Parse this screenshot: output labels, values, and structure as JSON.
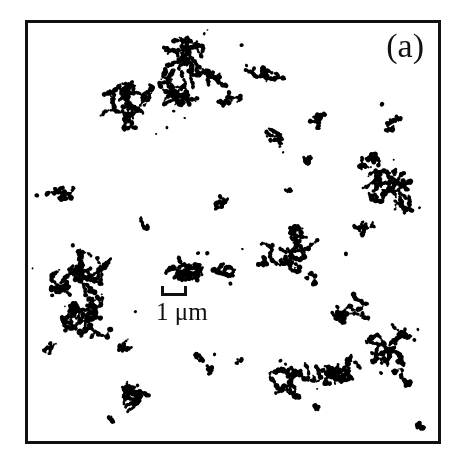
{
  "figure": {
    "domain_type": "micrograph",
    "panel_label": "(a)",
    "background_color": "#ffffff",
    "particle_color": "#000000",
    "frame_color": "#111111",
    "frame": {
      "x": 25,
      "y": 20,
      "width": 416,
      "height": 424,
      "border_px": 3
    },
    "image_width": 461,
    "image_height": 462
  },
  "scale_bar": {
    "label": "1 μm",
    "value": 1,
    "unit": "μm",
    "bar_length_px": 26,
    "position": {
      "x": 133,
      "y": 263
    }
  },
  "chart_data": {
    "type": "scatter",
    "title": "(a)",
    "xlabel": "",
    "ylabel": "",
    "xlim": [
      0,
      416
    ],
    "ylim": [
      0,
      424
    ],
    "grid": false,
    "legend": null,
    "scale_bar_px_per_micron": 26,
    "aggregate_count": 34,
    "aggregates": [
      {
        "id": "agg-01",
        "cx": 148,
        "cy": 48,
        "rx": 62,
        "ry": 36,
        "mass": 230,
        "seeds": 9,
        "label": "large-branched-cluster-top-left"
      },
      {
        "id": "agg-02",
        "cx": 108,
        "cy": 85,
        "rx": 38,
        "ry": 24,
        "mass": 150,
        "seeds": 6,
        "label": "dense-cluster-upper-left"
      },
      {
        "id": "agg-03",
        "cx": 236,
        "cy": 55,
        "rx": 26,
        "ry": 10,
        "mass": 52,
        "seeds": 4,
        "label": "short-chain-upper-mid"
      },
      {
        "id": "agg-04",
        "cx": 205,
        "cy": 78,
        "rx": 13,
        "ry": 8,
        "mass": 20,
        "seeds": 2,
        "label": "speck-upper-mid"
      },
      {
        "id": "agg-05",
        "cx": 300,
        "cy": 100,
        "rx": 14,
        "ry": 8,
        "mass": 22,
        "seeds": 2,
        "label": "speck-upper-right"
      },
      {
        "id": "agg-06",
        "cx": 245,
        "cy": 118,
        "rx": 13,
        "ry": 16,
        "mass": 26,
        "seeds": 2,
        "label": "short-chain-mid-upper"
      },
      {
        "id": "agg-07",
        "cx": 287,
        "cy": 133,
        "rx": 9,
        "ry": 10,
        "mass": 18,
        "seeds": 2,
        "label": "speck-mid-right"
      },
      {
        "id": "agg-08",
        "cx": 366,
        "cy": 97,
        "rx": 13,
        "ry": 13,
        "mass": 24,
        "seeds": 2,
        "label": "speck-right-upper"
      },
      {
        "id": "agg-09",
        "cx": 352,
        "cy": 142,
        "rx": 18,
        "ry": 10,
        "mass": 35,
        "seeds": 3,
        "label": "short-cluster-right"
      },
      {
        "id": "agg-10",
        "cx": 360,
        "cy": 175,
        "rx": 36,
        "ry": 28,
        "mass": 130,
        "seeds": 6,
        "label": "dense-cluster-right-edge"
      },
      {
        "id": "agg-11",
        "cx": 341,
        "cy": 207,
        "rx": 11,
        "ry": 9,
        "mass": 26,
        "seeds": 2,
        "label": "solid-blob-right"
      },
      {
        "id": "agg-12",
        "cx": 36,
        "cy": 167,
        "rx": 24,
        "ry": 12,
        "mass": 42,
        "seeds": 4,
        "label": "fragment-left-edge"
      },
      {
        "id": "agg-13",
        "cx": 198,
        "cy": 185,
        "rx": 8,
        "ry": 10,
        "mass": 16,
        "seeds": 2,
        "label": "speck-center"
      },
      {
        "id": "agg-14",
        "cx": 264,
        "cy": 171,
        "rx": 4,
        "ry": 4,
        "mass": 6,
        "seeds": 1,
        "label": "dot-center-right"
      },
      {
        "id": "agg-15",
        "cx": 118,
        "cy": 203,
        "rx": 7,
        "ry": 8,
        "mass": 12,
        "seeds": 1,
        "label": "speck-left-center"
      },
      {
        "id": "agg-16",
        "cx": 268,
        "cy": 232,
        "rx": 38,
        "ry": 26,
        "mass": 105,
        "seeds": 6,
        "label": "zigzag-chain-center-right"
      },
      {
        "id": "agg-17",
        "cx": 240,
        "cy": 242,
        "rx": 9,
        "ry": 5,
        "mass": 12,
        "seeds": 2,
        "label": "speck-center-lower"
      },
      {
        "id": "agg-18",
        "cx": 291,
        "cy": 259,
        "rx": 10,
        "ry": 7,
        "mass": 14,
        "seeds": 2,
        "label": "speck-right-lower"
      },
      {
        "id": "agg-19",
        "cx": 48,
        "cy": 253,
        "rx": 44,
        "ry": 24,
        "mass": 150,
        "seeds": 7,
        "label": "branched-cluster-left"
      },
      {
        "id": "agg-20",
        "cx": 178,
        "cy": 248,
        "rx": 42,
        "ry": 14,
        "mass": 120,
        "seeds": 6,
        "label": "elongated-aggregate-center"
      },
      {
        "id": "agg-21",
        "cx": 67,
        "cy": 300,
        "rx": 32,
        "ry": 22,
        "mass": 160,
        "seeds": 6,
        "label": "dense-compact-cluster-lower-left"
      },
      {
        "id": "agg-22",
        "cx": 329,
        "cy": 290,
        "rx": 22,
        "ry": 16,
        "mass": 60,
        "seeds": 4,
        "label": "cluster-lower-right"
      },
      {
        "id": "agg-23",
        "cx": 366,
        "cy": 325,
        "rx": 24,
        "ry": 30,
        "mass": 95,
        "seeds": 5,
        "label": "vertical-chain-lower-right"
      },
      {
        "id": "agg-24",
        "cx": 305,
        "cy": 350,
        "rx": 44,
        "ry": 16,
        "mass": 110,
        "seeds": 6,
        "label": "long-chain-bottom-right"
      },
      {
        "id": "agg-25",
        "cx": 262,
        "cy": 366,
        "rx": 24,
        "ry": 16,
        "mass": 70,
        "seeds": 4,
        "label": "cluster-bottom-center-right"
      },
      {
        "id": "agg-26",
        "cx": 178,
        "cy": 345,
        "rx": 10,
        "ry": 14,
        "mass": 26,
        "seeds": 2,
        "label": "speck-bottom-center"
      },
      {
        "id": "agg-27",
        "cx": 116,
        "cy": 380,
        "rx": 20,
        "ry": 26,
        "mass": 62,
        "seeds": 4,
        "label": "chain-bottom-left"
      },
      {
        "id": "agg-28",
        "cx": 24,
        "cy": 330,
        "rx": 9,
        "ry": 6,
        "mass": 10,
        "seeds": 2,
        "label": "speck-left-bottom"
      },
      {
        "id": "agg-29",
        "cx": 94,
        "cy": 326,
        "rx": 12,
        "ry": 7,
        "mass": 16,
        "seeds": 2,
        "label": "speck-lower-left"
      },
      {
        "id": "agg-30",
        "cx": 214,
        "cy": 343,
        "rx": 4,
        "ry": 4,
        "mass": 5,
        "seeds": 1,
        "label": "dot-bottom-center"
      },
      {
        "id": "agg-31",
        "cx": 378,
        "cy": 360,
        "rx": 13,
        "ry": 10,
        "mass": 20,
        "seeds": 2,
        "label": "speck-right-bottom"
      },
      {
        "id": "agg-32",
        "cx": 84,
        "cy": 402,
        "rx": 5,
        "ry": 5,
        "mass": 6,
        "seeds": 1,
        "label": "dot-bottom-left"
      },
      {
        "id": "agg-33",
        "cx": 292,
        "cy": 392,
        "rx": 5,
        "ry": 4,
        "mass": 5,
        "seeds": 1,
        "label": "dot-bottom"
      },
      {
        "id": "agg-34",
        "cx": 396,
        "cy": 406,
        "rx": 9,
        "ry": 6,
        "mass": 10,
        "seeds": 2,
        "label": "speck-bottom-right-corner"
      }
    ]
  }
}
